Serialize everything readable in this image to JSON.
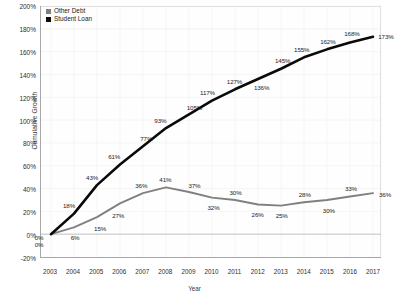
{
  "chart_data": {
    "type": "line",
    "title": "",
    "xlabel": "Year",
    "ylabel": "Cumulative Growth",
    "categories": [
      "2003",
      "2004",
      "2005",
      "2006",
      "2007",
      "2008",
      "2009",
      "2010",
      "2011",
      "2012",
      "2013",
      "2014",
      "2015",
      "2016",
      "2017"
    ],
    "ylim": [
      -20,
      200
    ],
    "ytick_labels": [
      "200%",
      "180%",
      "160%",
      "140%",
      "120%",
      "100%",
      "80%",
      "60%",
      "40%",
      "20%",
      "0%",
      "-20%"
    ],
    "ytick_values": [
      200,
      180,
      160,
      140,
      120,
      100,
      80,
      60,
      40,
      20,
      0,
      -20
    ],
    "grid": true,
    "legend_position": "top-left",
    "series": [
      {
        "name": "Other Debt",
        "color": "#808080",
        "values": [
          0,
          6,
          15,
          27,
          36,
          41,
          37,
          32,
          30,
          26,
          25,
          28,
          30,
          33,
          36
        ],
        "labels": [
          "0%",
          "6%",
          "15%",
          "27%",
          "36%",
          "41%",
          "37%",
          "32%",
          "30%",
          "26%",
          "25%",
          "28%",
          "30%",
          "33%",
          "36%"
        ]
      },
      {
        "name": "Student Loan",
        "color": "#0a0a0a",
        "values": [
          0,
          18,
          43,
          61,
          77,
          93,
          105,
          117,
          127,
          136,
          145,
          155,
          162,
          168,
          173
        ],
        "labels": [
          "0%",
          "18%",
          "43%",
          "61%",
          "77%",
          "93%",
          "105%",
          "117%",
          "127%",
          "136%",
          "145%",
          "155%",
          "162%",
          "168%",
          "173%"
        ]
      }
    ]
  }
}
